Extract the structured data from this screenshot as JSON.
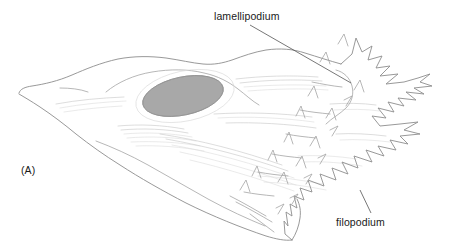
{
  "figure": {
    "panel_label": "(A)",
    "background_color": "#ffffff",
    "width": 455,
    "height": 251,
    "annotations": [
      {
        "id": "lamellipodium",
        "label": "lamellipodium",
        "text_position": {
          "x": 214,
          "y": 10
        },
        "leader_line": {
          "x1": 250,
          "y1": 25,
          "x2": 351,
          "y2": 83
        },
        "color": "#1a1a1a"
      },
      {
        "id": "filopodium",
        "label": "filopodium",
        "text_position": {
          "x": 336,
          "y": 216
        },
        "leader_line": {
          "x1": 371,
          "y1": 213,
          "x2": 360,
          "y2": 190
        },
        "color": "#1a1a1a"
      }
    ],
    "parts": {
      "nucleus": {
        "name": "nucleus",
        "center": {
          "x": 183,
          "y": 96
        },
        "radius_x": 41,
        "radius_y": 19,
        "rotation_deg": -12,
        "fill_color": "#a8a8a8",
        "stroke_color": "#9a9a9a"
      },
      "cell_body": {
        "name": "cell-body-outline",
        "stroke_color": "#8d8d8d",
        "left_tip": {
          "x": 19,
          "y": 93
        },
        "right_edge_x": 432,
        "bottom_tip": {
          "x": 292,
          "y": 240
        }
      },
      "stress_fibers": {
        "name": "stress-fibers",
        "stroke_color": "#cfcfcf",
        "count": 28
      },
      "leading_edge": {
        "name": "spiky-leading-edge",
        "description": "ruffled lamellipodium with many pointed filopodia on the right side",
        "stroke_color": "#8d8d8d"
      }
    }
  }
}
